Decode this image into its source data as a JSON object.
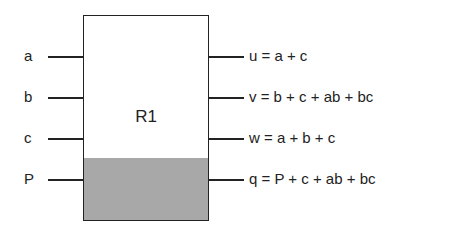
{
  "block": {
    "label": "R1",
    "shaded_region": "lower"
  },
  "inputs": [
    {
      "label": "a",
      "y": 56
    },
    {
      "label": "b",
      "y": 97
    },
    {
      "label": "c",
      "y": 138
    },
    {
      "label": "P",
      "y": 179
    }
  ],
  "outputs": [
    {
      "label": "u = a + c",
      "y": 56
    },
    {
      "label": "v = b + c + ab + bc",
      "y": 97
    },
    {
      "label": "w = a + b + c",
      "y": 138
    },
    {
      "label": "q = P + c + ab + bc",
      "y": 179
    }
  ]
}
